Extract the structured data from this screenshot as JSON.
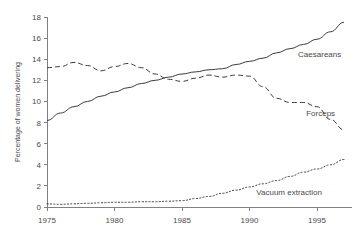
{
  "chart_data": {
    "type": "line",
    "title": "",
    "xlabel": "",
    "ylabel": "Percentage of women delivering",
    "xlim": [
      1975,
      1997
    ],
    "ylim": [
      0,
      18
    ],
    "grid": false,
    "legend_position": "inline-right",
    "x_ticks": [
      "1975",
      "1980",
      "1985",
      "1990",
      "1995"
    ],
    "x_tick_values": [
      1975,
      1980,
      1985,
      1990,
      1995
    ],
    "y_ticks": [
      "0",
      "2",
      "4",
      "6",
      "8",
      "10",
      "12",
      "14",
      "16",
      "18"
    ],
    "y_tick_values": [
      0,
      2,
      4,
      6,
      8,
      10,
      12,
      14,
      16,
      18
    ],
    "x": [
      1975,
      1976,
      1977,
      1978,
      1979,
      1980,
      1981,
      1982,
      1983,
      1984,
      1985,
      1986,
      1987,
      1988,
      1989,
      1990,
      1991,
      1992,
      1993,
      1994,
      1995,
      1996,
      1997
    ],
    "series": [
      {
        "name": "Caesareans",
        "style": "solid",
        "color": "#3b3b3b",
        "values": [
          8.2,
          8.9,
          9.5,
          10.0,
          10.5,
          10.9,
          11.3,
          11.7,
          12.0,
          12.3,
          12.6,
          12.8,
          13.0,
          13.1,
          13.5,
          13.8,
          14.1,
          14.6,
          15.0,
          15.4,
          15.9,
          16.6,
          17.5
        ]
      },
      {
        "name": "Forceps",
        "style": "dashed",
        "color": "#3b3b3b",
        "values": [
          13.2,
          13.3,
          13.7,
          13.4,
          12.9,
          13.3,
          13.6,
          13.2,
          12.6,
          12.1,
          11.9,
          12.2,
          12.5,
          12.3,
          12.5,
          12.4,
          11.4,
          10.3,
          9.9,
          9.9,
          9.5,
          8.3,
          7.3
        ]
      },
      {
        "name": "Vacuum extraction",
        "style": "dotted",
        "color": "#3b3b3b",
        "values": [
          0.3,
          0.25,
          0.3,
          0.35,
          0.4,
          0.45,
          0.45,
          0.5,
          0.5,
          0.55,
          0.6,
          0.8,
          1.0,
          1.3,
          1.6,
          1.9,
          2.2,
          2.5,
          2.9,
          3.3,
          3.6,
          4.0,
          4.5
        ]
      }
    ],
    "annotations": [
      {
        "text": "Caesareans",
        "x": 1993.6,
        "y": 14.2
      },
      {
        "text": "Forceps",
        "x": 1994.2,
        "y": 8.6
      },
      {
        "text": "Vacuum extraction",
        "x": 1990.5,
        "y": 1.15
      }
    ]
  }
}
